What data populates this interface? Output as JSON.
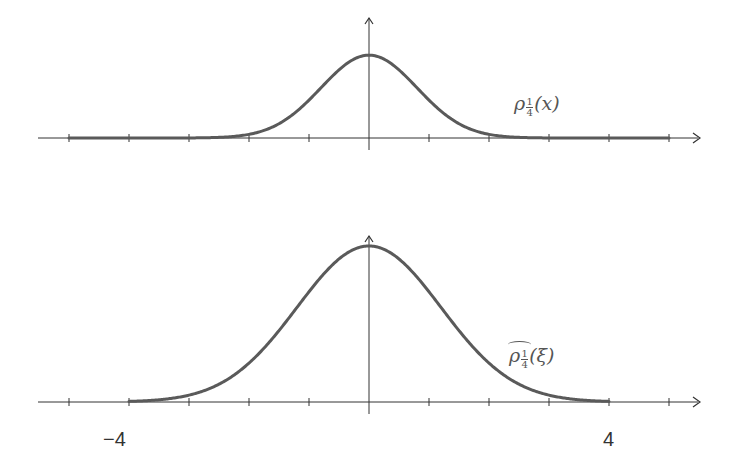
{
  "chart_data": [
    {
      "type": "line",
      "title": "",
      "series": [
        {
          "name": "rho_{1/4}(x)",
          "label": "ρ¼(x)",
          "sigma": 0.8,
          "peak": 1.38,
          "x_range": [
            -5,
            5
          ]
        }
      ],
      "x_ticks": [
        -5,
        -4,
        -3,
        -2,
        -1,
        1,
        2,
        3,
        4,
        5
      ],
      "xlabel": "",
      "ylabel": "",
      "grid": false,
      "annotation": {
        "text": "ρ_{1/4}(x)",
        "x": 2.3,
        "y": 0.5
      }
    },
    {
      "type": "line",
      "title": "",
      "series": [
        {
          "name": "hat rho_{1/4}(xi)",
          "label": "ρ̂¼(ξ)",
          "sigma": 1.2,
          "peak": 2.6,
          "x_range": [
            -4,
            4
          ]
        }
      ],
      "x_ticks": [
        -5,
        -4,
        -3,
        -2,
        -1,
        1,
        2,
        3,
        4,
        5
      ],
      "tick_labels": [
        {
          "x": -4,
          "text": "−4"
        },
        {
          "x": 4,
          "text": "4"
        }
      ],
      "xlabel": "",
      "ylabel": "",
      "grid": false,
      "annotation": {
        "text": "\\widehat{ρ_{1/4}}(ξ)",
        "x": 2.3,
        "y": 0.7
      }
    }
  ],
  "labels": {
    "top": {
      "rho": "ρ",
      "num": "1",
      "den": "4",
      "arg": "(x)"
    },
    "bottom": {
      "rho": "ρ",
      "num": "1",
      "den": "4",
      "arg": "(ξ)"
    },
    "tick_neg4": "−4",
    "tick_pos4": "4"
  },
  "colors": {
    "curve": "#5a5a5a",
    "axis": "#333333"
  }
}
